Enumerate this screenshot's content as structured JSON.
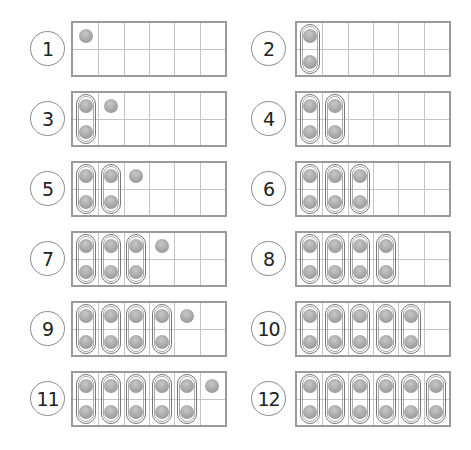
{
  "worksheet": {
    "columns": 6,
    "rows": 2,
    "colors": {
      "frame_border": "#9a9a9a",
      "grid_line": "#c4c4c4",
      "counter": "#a6a6a6",
      "pill_outline": "#777777"
    },
    "items": [
      {
        "label": "1",
        "count": 1
      },
      {
        "label": "2",
        "count": 2
      },
      {
        "label": "3",
        "count": 3
      },
      {
        "label": "4",
        "count": 4
      },
      {
        "label": "5",
        "count": 5
      },
      {
        "label": "6",
        "count": 6
      },
      {
        "label": "7",
        "count": 7
      },
      {
        "label": "8",
        "count": 8
      },
      {
        "label": "9",
        "count": 9
      },
      {
        "label": "10",
        "count": 10
      },
      {
        "label": "11",
        "count": 11
      },
      {
        "label": "12",
        "count": 12
      }
    ]
  }
}
